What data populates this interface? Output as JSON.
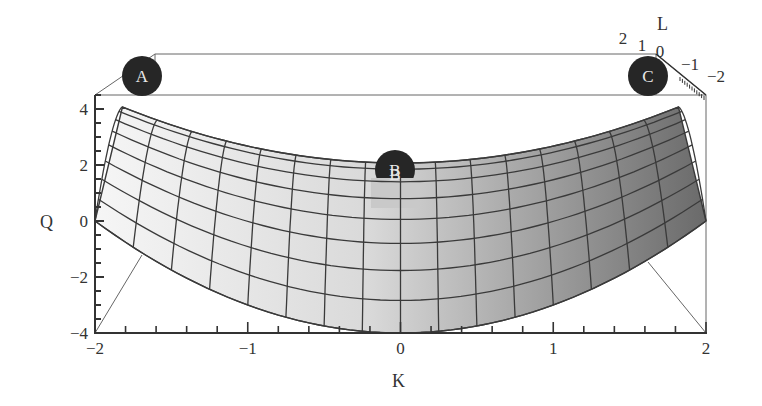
{
  "chart_data": {
    "type": "surface3d",
    "title": "",
    "function_description": "Saddle-shaped surface Q over K and L; Q rises toward K = ±2 along the back edge and is lowest at K = 0 on the front edge",
    "xlabel": "K",
    "ylabel": "L",
    "zlabel": "Q",
    "x_ticks": [
      -2,
      -1,
      0,
      1,
      2
    ],
    "x_tick_labels": [
      "−2",
      "−1",
      "0",
      "1",
      "2"
    ],
    "y_ticks": [
      2,
      1,
      0,
      -1,
      -2
    ],
    "y_tick_labels": [
      "2",
      "1",
      "0",
      "−1",
      "−2"
    ],
    "z_ticks": [
      4,
      2,
      0,
      -2,
      -4
    ],
    "z_tick_labels": [
      "4",
      "2",
      "0",
      "−2",
      "−4"
    ],
    "xlim": [
      -2,
      2
    ],
    "ylim": [
      -2,
      2
    ],
    "zlim": [
      -4,
      4
    ],
    "mesh": {
      "k_lines": 16,
      "l_lines": 9
    },
    "surface_samples": [
      {
        "K": -2,
        "L": 2,
        "Q": 4
      },
      {
        "K": 0,
        "L": 2,
        "Q": 2
      },
      {
        "K": 2,
        "L": 2,
        "Q": 4
      },
      {
        "K": -2,
        "L": -2,
        "Q": 0
      },
      {
        "K": 0,
        "L": -2,
        "Q": -4
      },
      {
        "K": 2,
        "L": -2,
        "Q": 0
      }
    ],
    "markers": [
      {
        "label": "A",
        "K": -2,
        "L": 2,
        "Q": 4
      },
      {
        "label": "B",
        "K": 0,
        "L": 2,
        "Q": 2
      },
      {
        "label": "C",
        "K": 2,
        "L": 2,
        "Q": 4
      }
    ],
    "shading": {
      "light": "#f4f4f4",
      "dark": "#6e6e6e",
      "direction": "left-to-right"
    },
    "grid": false,
    "legend": null
  },
  "axes": {
    "k_title": "K",
    "q_title": "Q",
    "l_title": "L"
  },
  "colors": {
    "mesh_line": "#3a3a3a",
    "box_line": "#555555",
    "marker_fill": "#262626",
    "marker_text": "#e8e8e8"
  }
}
